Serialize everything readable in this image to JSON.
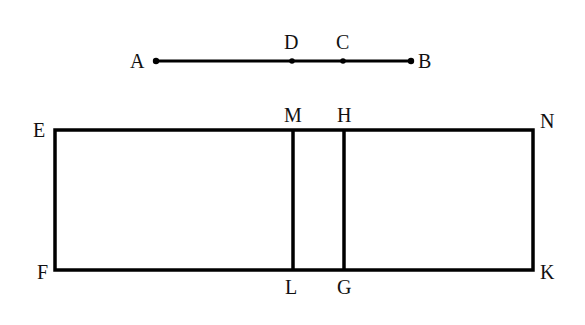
{
  "diagram": {
    "type": "geometric-construction",
    "stroke_color": "#000000",
    "label_color": "#111111",
    "segment": {
      "endpoints": [
        "A",
        "B"
      ],
      "points_on_segment": [
        "A",
        "D",
        "C",
        "B"
      ],
      "labels": {
        "A": "A",
        "D": "D",
        "C": "C",
        "B": "B"
      }
    },
    "rectangle": {
      "corners": [
        "E",
        "N",
        "K",
        "F"
      ],
      "internal_lines": [
        {
          "from": "M",
          "to": "L"
        },
        {
          "from": "H",
          "to": "G"
        }
      ],
      "labels": {
        "E": "E",
        "M": "M",
        "H": "H",
        "N": "N",
        "F": "F",
        "L": "L",
        "G": "G",
        "K": "K"
      }
    }
  }
}
